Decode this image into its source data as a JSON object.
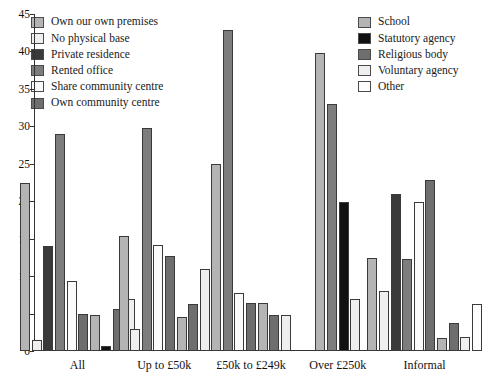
{
  "legend_left": {
    "items": [
      {
        "label": "Own our own  premises",
        "color": "#b4b4b4"
      },
      {
        "label": "No physical base",
        "color": "#efefef"
      },
      {
        "label": "Private residence",
        "color": "#3a3a3a"
      },
      {
        "label": "Rented office",
        "color": "#7d7d7d"
      },
      {
        "label": "Share community centre",
        "color": "#fbfbfb"
      },
      {
        "label": "Own community centre",
        "color": "#6e6e6e"
      }
    ]
  },
  "legend_right": {
    "items": [
      {
        "label": "School",
        "color": "#b4b4b4"
      },
      {
        "label": "Statutory agency",
        "color": "#111111"
      },
      {
        "label": "Religious body",
        "color": "#6e6e6e"
      },
      {
        "label": "Voluntary agency",
        "color": "#efefef"
      },
      {
        "label": "Other",
        "color": "#fdfdfd"
      }
    ]
  },
  "chart_data": {
    "type": "bar",
    "title": "",
    "xlabel": "",
    "ylabel": "",
    "ylim": [
      0,
      45
    ],
    "yticks": [
      0,
      5,
      10,
      15,
      20,
      25,
      30,
      35,
      40,
      45
    ],
    "grid": false,
    "legend_position": "top",
    "categories": [
      "All",
      "Up to £50k",
      "£50k to £249k",
      "Over £250k",
      "Informal"
    ],
    "series": [
      {
        "name": "Own our own  premises",
        "color": "#b4b4b4",
        "values": [
          22.4,
          15.4,
          25.0,
          39.8,
          12.4
        ]
      },
      {
        "name": "No physical base",
        "color": "#efefef",
        "values": [
          1.5,
          3.0,
          0.0,
          0.0,
          8.0
        ]
      },
      {
        "name": "Private residence",
        "color": "#3a3a3a",
        "values": [
          14.0,
          0.0,
          0.0,
          0.0,
          21.0
        ]
      },
      {
        "name": "Rented office",
        "color": "#7d7d7d",
        "values": [
          29.0,
          29.8,
          42.8,
          33.0,
          12.3
        ]
      },
      {
        "name": "Share community centre",
        "color": "#fbfbfb",
        "values": [
          9.4,
          14.2,
          7.7,
          0.0,
          19.9
        ]
      },
      {
        "name": "Own community centre",
        "color": "#6e6e6e",
        "values": [
          5.0,
          12.7,
          6.4,
          0.0,
          22.8
        ]
      },
      {
        "name": "School",
        "color": "#b4b4b4",
        "values": [
          4.8,
          4.6,
          6.4,
          0.0,
          1.8
        ]
      },
      {
        "name": "Statutory agency",
        "color": "#111111",
        "values": [
          0.7,
          0.0,
          0.0,
          19.9,
          0.0
        ]
      },
      {
        "name": "Religious body",
        "color": "#6e6e6e",
        "values": [
          5.6,
          6.3,
          4.8,
          0.0,
          3.7
        ]
      },
      {
        "name": "Voluntary agency",
        "color": "#efefef",
        "values": [
          6.9,
          11.0,
          4.8,
          6.9,
          1.9
        ]
      },
      {
        "name": "Other",
        "color": "#fdfdfd",
        "values": [
          0.0,
          0.0,
          0.0,
          0.0,
          6.3
        ]
      }
    ]
  }
}
